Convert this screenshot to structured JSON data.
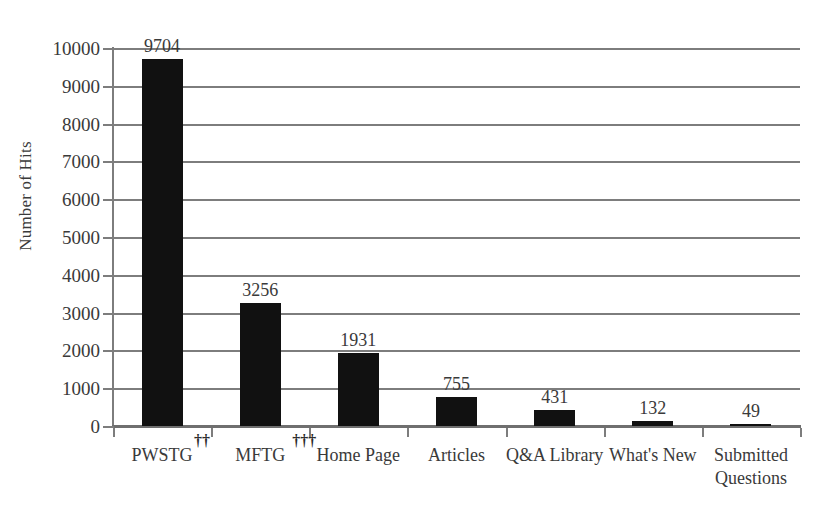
{
  "chart_data": {
    "type": "bar",
    "title": "",
    "subtitle": "",
    "xlabel": "",
    "ylabel": "Number of Hits",
    "ylim": [
      0,
      10000
    ],
    "ytick_step": 1000,
    "grid": true,
    "legend": false,
    "bar_color": "#111111",
    "gridline_color": "#7d7d7d",
    "text_color": "#3a3a3a",
    "categories": [
      "PWSTG",
      "MFTG",
      "Home Page",
      "Articles",
      "Q&A Library",
      "What's New",
      "Submitted Questions"
    ],
    "category_lines": [
      [
        "PWSTG"
      ],
      [
        "MFTG"
      ],
      [
        "Home Page"
      ],
      [
        "Articles"
      ],
      [
        "Q&A Library"
      ],
      [
        "What's New"
      ],
      [
        "Submitted",
        "Questions"
      ]
    ],
    "category_footnotes": [
      "††",
      "†††",
      "",
      "",
      "",
      "",
      ""
    ],
    "values": [
      9704,
      3256,
      1931,
      755,
      431,
      132,
      49
    ],
    "value_labels": [
      "9704",
      "3256",
      "1931",
      "755",
      "431",
      "132",
      "49"
    ],
    "ytick_labels": [
      "10000",
      "9000",
      "8000",
      "7000",
      "6000",
      "5000",
      "4000",
      "3000",
      "2000",
      "1000",
      "0"
    ],
    "ytick_values": [
      10000,
      9000,
      8000,
      7000,
      6000,
      5000,
      4000,
      3000,
      2000,
      1000,
      0
    ]
  }
}
